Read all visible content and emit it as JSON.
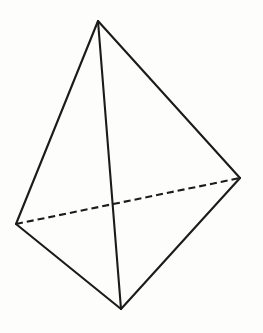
{
  "figure": {
    "name": "tetrahedron",
    "title": "Tetrahedron",
    "canvas": {
      "width": 263,
      "height": 333,
      "background_color": "#fdfdfc"
    },
    "style": {
      "line_color": "#1b1b1b",
      "line_width": 2.1,
      "dash_pattern": "7 4",
      "fill": "none"
    },
    "vertices": [
      {
        "id": "apex",
        "label": "apex",
        "x": 98,
        "y": 21
      },
      {
        "id": "left",
        "label": "left vertex",
        "x": 16,
        "y": 224
      },
      {
        "id": "right",
        "label": "right vertex",
        "x": 240,
        "y": 178
      },
      {
        "id": "bottom",
        "label": "front vertex",
        "x": 121,
        "y": 309
      }
    ],
    "edges": [
      {
        "id": "apex-left",
        "from": "apex",
        "to": "left",
        "visible": true,
        "style": "solid",
        "path": "M 98 21 L 16 224"
      },
      {
        "id": "apex-right",
        "from": "apex",
        "to": "right",
        "visible": true,
        "style": "solid",
        "path": "M 98 21 L 240 178"
      },
      {
        "id": "apex-bottom",
        "from": "apex",
        "to": "bottom",
        "visible": true,
        "style": "solid",
        "path": "M 98 21 L 121 309"
      },
      {
        "id": "left-bottom",
        "from": "left",
        "to": "bottom",
        "visible": true,
        "style": "solid",
        "path": "M 16 224 L 121 309"
      },
      {
        "id": "right-bottom",
        "from": "right",
        "to": "bottom",
        "visible": true,
        "style": "solid",
        "path": "M 240 178 L 121 309"
      },
      {
        "id": "left-right",
        "from": "left",
        "to": "right",
        "visible": false,
        "style": "dashed",
        "path": "M 16 224 L 240 178"
      }
    ]
  }
}
